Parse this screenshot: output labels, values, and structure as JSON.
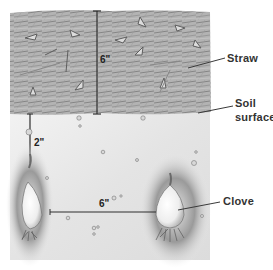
{
  "diagram": {
    "layers": [
      {
        "name": "straw",
        "label": "Straw"
      },
      {
        "name": "soil",
        "label": "Soil surface"
      }
    ],
    "labels": {
      "straw": "Straw",
      "soil_line1": "Soil",
      "soil_line2": "surface",
      "clove": "Clove"
    },
    "dimensions": {
      "straw_depth": "6\"",
      "planting_depth": "2\"",
      "clove_spacing": "6\""
    },
    "colors": {
      "straw_fill": "#a9a9a9",
      "straw_dark": "#6e6e6e",
      "soil_fill": "#ececec",
      "hole_shadow": "#8a8a8a",
      "clove_fill": "#f7f7f7",
      "line": "#3a3a3a",
      "text": "#333333"
    }
  }
}
